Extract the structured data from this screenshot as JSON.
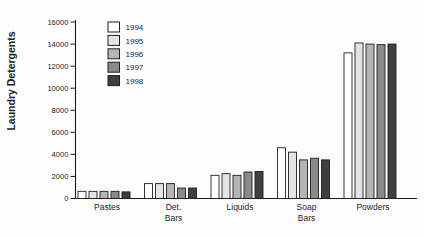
{
  "figure": {
    "background": "#fdfdfd",
    "axis_color": "#1a1a1a",
    "bar_border_color": "#1f1f1f"
  },
  "chart_data": {
    "type": "bar",
    "title": "",
    "xlabel": "",
    "ylabel": "Laundry Detergents",
    "ylim": [
      0,
      16000
    ],
    "y_ticks": [
      0,
      2000,
      4000,
      6000,
      8000,
      10000,
      12000,
      14000,
      16000
    ],
    "grid": false,
    "legend_position": "upper-left-inside",
    "categories": [
      "Pastes",
      "Det. Bars",
      "Liquids",
      "Soap Bars",
      "Powders"
    ],
    "category_label_lines": [
      [
        "Pastes"
      ],
      [
        "Det.",
        "Bars"
      ],
      [
        "Liquids"
      ],
      [
        "Soap",
        "Bars"
      ],
      [
        "Powders"
      ]
    ],
    "series": [
      {
        "name": "1994",
        "color": "#ffffff",
        "values": [
          650,
          1350,
          2100,
          4600,
          13200
        ]
      },
      {
        "name": "1995",
        "color": "#e4e4e4",
        "values": [
          650,
          1350,
          2250,
          4200,
          14100
        ]
      },
      {
        "name": "1996",
        "color": "#b5b5b5",
        "values": [
          650,
          1350,
          2100,
          3500,
          14000
        ]
      },
      {
        "name": "1997",
        "color": "#8a8a8a",
        "values": [
          650,
          950,
          2400,
          3650,
          13950
        ]
      },
      {
        "name": "1998",
        "color": "#3f3f3f",
        "values": [
          600,
          950,
          2450,
          3500,
          14000
        ]
      }
    ]
  }
}
